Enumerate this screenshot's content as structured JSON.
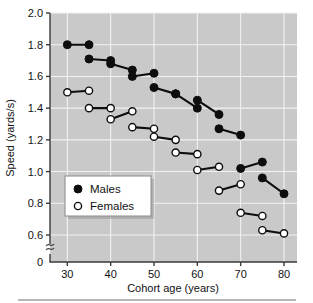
{
  "chart_data": {
    "type": "line",
    "title": "",
    "xlabel": "Cohort age (years)",
    "ylabel": "Speed (yards/s)",
    "xlim": [
      26,
      83
    ],
    "ylim": [
      0.52,
      2.0
    ],
    "xticks": [
      30,
      40,
      50,
      60,
      70,
      80
    ],
    "xtick_labels": [
      "30",
      "40",
      "50",
      "60",
      "70",
      "80"
    ],
    "yticks": [
      0.6,
      0.8,
      1.0,
      1.2,
      1.4,
      1.6,
      1.8,
      2.0
    ],
    "ytick_labels": [
      "0.6",
      "0.8",
      "1.0",
      "1.2",
      "1.4",
      "1.6",
      "1.8",
      "2.0"
    ],
    "y_axis_break": true,
    "y_origin_label": "0",
    "grid": true,
    "legend_position": "lower-left",
    "series": [
      {
        "name": "Males",
        "marker": "filled-circle",
        "color": "#0d0d0d",
        "segments": [
          {
            "x": [
              30,
              35
            ],
            "y": [
              1.8,
              1.8
            ]
          },
          {
            "x": [
              35,
              40
            ],
            "y": [
              1.71,
              1.7
            ]
          },
          {
            "x": [
              40,
              45
            ],
            "y": [
              1.68,
              1.64
            ]
          },
          {
            "x": [
              45,
              50
            ],
            "y": [
              1.6,
              1.62
            ]
          },
          {
            "x": [
              50,
              55
            ],
            "y": [
              1.53,
              1.49
            ]
          },
          {
            "x": [
              55,
              60
            ],
            "y": [
              1.49,
              1.4
            ]
          },
          {
            "x": [
              60,
              65
            ],
            "y": [
              1.45,
              1.36
            ]
          },
          {
            "x": [
              65,
              70
            ],
            "y": [
              1.27,
              1.23
            ]
          },
          {
            "x": [
              70,
              75
            ],
            "y": [
              1.02,
              1.06
            ]
          },
          {
            "x": [
              75,
              80
            ],
            "y": [
              0.96,
              0.86
            ]
          }
        ]
      },
      {
        "name": "Females",
        "marker": "open-circle",
        "color": "#ffffff",
        "segments": [
          {
            "x": [
              30,
              35
            ],
            "y": [
              1.5,
              1.51
            ]
          },
          {
            "x": [
              35,
              40
            ],
            "y": [
              1.4,
              1.4
            ]
          },
          {
            "x": [
              40,
              45
            ],
            "y": [
              1.33,
              1.38
            ]
          },
          {
            "x": [
              45,
              50
            ],
            "y": [
              1.28,
              1.27
            ]
          },
          {
            "x": [
              50,
              55
            ],
            "y": [
              1.22,
              1.2
            ]
          },
          {
            "x": [
              55,
              60
            ],
            "y": [
              1.12,
              1.11
            ]
          },
          {
            "x": [
              60,
              65
            ],
            "y": [
              1.01,
              1.03
            ]
          },
          {
            "x": [
              65,
              70
            ],
            "y": [
              0.88,
              0.92
            ]
          },
          {
            "x": [
              70,
              75
            ],
            "y": [
              0.74,
              0.72
            ]
          },
          {
            "x": [
              75,
              80
            ],
            "y": [
              0.63,
              0.61
            ]
          }
        ]
      }
    ],
    "legend": [
      {
        "label": "Males",
        "marker": "filled-circle"
      },
      {
        "label": "Females",
        "marker": "open-circle"
      }
    ],
    "colors": {
      "plot_background": "#c9c9c9",
      "gridline": "#f2f2f2",
      "axis": "#3a3a3a",
      "marker_male": "#0d0d0d",
      "marker_female": "#ffffff",
      "page_background": "#ffffff"
    }
  }
}
